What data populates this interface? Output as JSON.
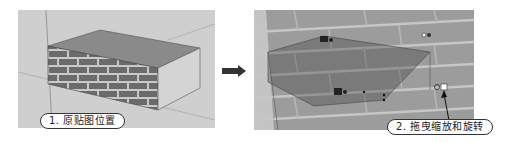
{
  "steps": [
    {
      "number": "1.",
      "label": "1. 原贴图位置",
      "description": "original texture position"
    },
    {
      "number": "2.",
      "label": "2. 拖曳缩放和旋转",
      "description": "drag to scale and rotate"
    }
  ],
  "icons": {
    "flow_arrow": "right-arrow-icon",
    "pins": [
      "move-pin-icon",
      "scale-rotate-pin-icon",
      "distort-pin-icon",
      "scale-shear-pin-icon"
    ]
  },
  "colors": {
    "background": "#ffffff",
    "viewport_light": "#cfcfcf",
    "brick": "#6e6e6e",
    "mortar": "#c8c8c8",
    "box_top": "#8a8a8a",
    "box_side": "#d4d4d4",
    "wall_texture": "#9a9a9a",
    "label_border": "#333333"
  }
}
